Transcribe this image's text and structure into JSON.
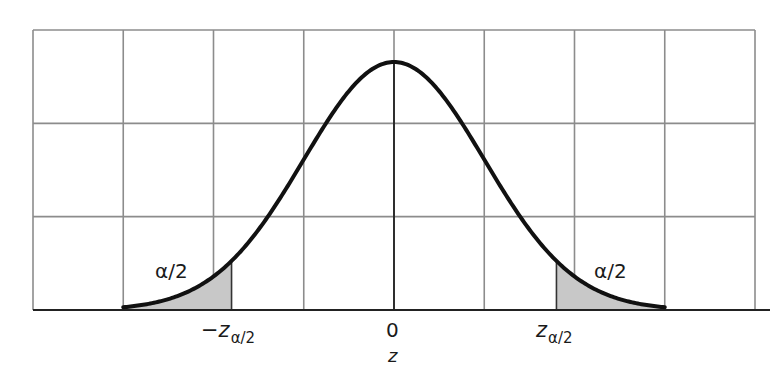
{
  "chart_data": {
    "type": "area",
    "title": "",
    "xlabel": "z",
    "ylabel": "",
    "grid": true,
    "grid_columns": 8,
    "grid_rows": 3,
    "x_ticks": [
      {
        "label": "-z_{α/2}",
        "display": "−z",
        "sub": "α/2",
        "position": "lower critical value"
      },
      {
        "label": "0",
        "display": "0",
        "position": "mean"
      },
      {
        "label": "z_{α/2}",
        "display": "z",
        "sub": "α/2",
        "position": "upper critical value"
      }
    ],
    "curve": {
      "distribution": "standard normal",
      "mean": 0,
      "sd": 1,
      "x_range_sd": [
        -3,
        3
      ]
    },
    "shaded_regions": [
      {
        "side": "left",
        "label": "α/2",
        "from": "-∞",
        "to": "-z_{α/2}",
        "approx_to_sd": -1.8,
        "fill": "#c8c8c8"
      },
      {
        "side": "right",
        "label": "α/2",
        "from": "z_{α/2}",
        "to": "+∞",
        "approx_from_sd": 1.8,
        "fill": "#c8c8c8"
      }
    ],
    "annotations": [
      "α/2",
      "α/2"
    ],
    "colors": {
      "curve": "#111111",
      "grid": "#8c8c8c",
      "shade": "#c8c8c8",
      "axis": "#222222"
    }
  },
  "labels": {
    "left_tail": "α/2",
    "right_tail": "α/2",
    "neg_crit_main": "−z",
    "neg_crit_sub": "α/2",
    "pos_crit_main": "z",
    "pos_crit_sub": "α/2",
    "zero": "0",
    "axis_title": "z"
  }
}
